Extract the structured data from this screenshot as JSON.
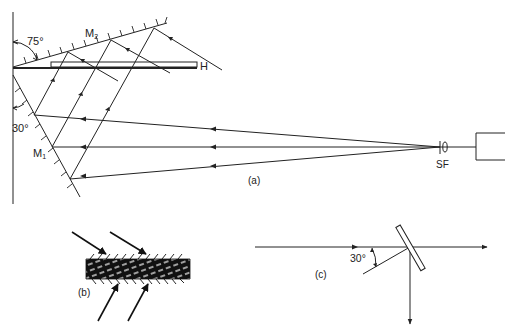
{
  "figure": {
    "panel_a": {
      "caption": "(a)",
      "angle_top": "75°",
      "angle_bottom": "30°",
      "mirror_1": "M",
      "mirror_1_sub": "1",
      "mirror_2": "M",
      "mirror_2_sub": "2",
      "plate": "H",
      "spatial_filter": "SF"
    },
    "panel_b": {
      "caption": "(b)"
    },
    "panel_c": {
      "caption": "(c)",
      "angle": "30°"
    },
    "colors": {
      "stroke": "#222222",
      "background": "#ffffff"
    }
  }
}
